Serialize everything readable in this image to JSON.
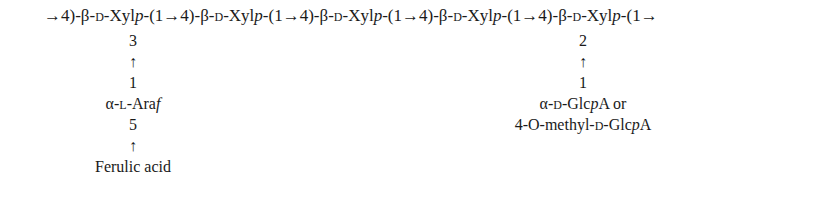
{
  "main_chain": {
    "start_arrow": "→",
    "units": [
      {
        "pos_in": "4)-",
        "anomer": "β",
        "config": "D",
        "sugar": "Xyl",
        "ring": "p",
        "link_out": "-(1"
      },
      {
        "pos_in": "→4)-",
        "anomer": "β",
        "config": "D",
        "sugar": "Xyl",
        "ring": "p",
        "link_out": "-(1"
      },
      {
        "pos_in": "→4)-",
        "anomer": "β",
        "config": "D",
        "sugar": "Xyl",
        "ring": "p",
        "link_out": "-(1"
      },
      {
        "pos_in": "→4)-",
        "anomer": "β",
        "config": "D",
        "sugar": "Xyl",
        "ring": "p",
        "link_out": "-(1"
      },
      {
        "pos_in": "→4)-",
        "anomer": "β",
        "config": "D",
        "sugar": "Xyl",
        "ring": "p",
        "link_out": "-(1"
      }
    ],
    "end_arrow": "→"
  },
  "branch_arabinose": {
    "attach_position": "3",
    "arrow": "↑",
    "anomeric_position": "1",
    "anomer": "α",
    "config": "L",
    "sugar": "Ara",
    "ring": "f",
    "sub_position": "5",
    "sub_arrow": "↑",
    "substituent": "Ferulic acid"
  },
  "branch_glucuronic": {
    "attach_position": "2",
    "arrow": "↑",
    "anomeric_position": "1",
    "line1_anomer": "α",
    "line1_config": "D",
    "line1_sugar": "Glc",
    "line1_ring": "p",
    "line1_suffix": "A or",
    "line2_prefix": "4-O-methyl-",
    "line2_config": "D",
    "line2_sugar": "Glc",
    "line2_ring": "p",
    "line2_suffix": "A"
  }
}
